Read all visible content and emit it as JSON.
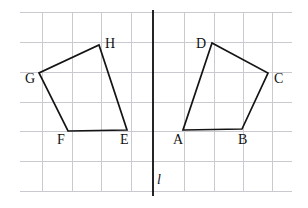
{
  "figure": {
    "width": 308,
    "height": 208,
    "background_color": "#ffffff"
  },
  "grid": {
    "line_color": "#c9c9cf",
    "x_start": 20,
    "x_end": 292,
    "y_start": 12,
    "y_end": 191,
    "vertical_x": [
      42,
      72,
      101,
      131,
      184,
      214,
      243,
      272
    ],
    "horizontal_y": [
      12,
      42,
      72,
      102,
      131,
      161,
      191
    ],
    "spacing": 30
  },
  "mirror_line": {
    "label": "l",
    "color": "#1a1a1a",
    "x": 153,
    "y_top": 10,
    "y_bottom": 196,
    "label_x": 157,
    "label_y": 173
  },
  "polygons": [
    {
      "name": "preimage-quadrilateral-abcd",
      "vertex_order": "A-B-C-D",
      "stroke_color": "#141414",
      "points": "183,130 242,129 268,73 212,43",
      "vertices": [
        {
          "label": "A",
          "x": 183,
          "y": 130,
          "label_x": 173,
          "label_y": 133
        },
        {
          "label": "B",
          "x": 242,
          "y": 129,
          "label_x": 238,
          "label_y": 133
        },
        {
          "label": "C",
          "x": 268,
          "y": 73,
          "label_x": 274,
          "label_y": 72
        },
        {
          "label": "D",
          "x": 212,
          "y": 43,
          "label_x": 196,
          "label_y": 37
        }
      ]
    },
    {
      "name": "image-quadrilateral-efgh",
      "vertex_order": "E-F-G-H",
      "stroke_color": "#141414",
      "points": "127,130 68,131 39,73 99,45",
      "vertices": [
        {
          "label": "E",
          "x": 127,
          "y": 130,
          "label_x": 120,
          "label_y": 133
        },
        {
          "label": "F",
          "x": 68,
          "y": 131,
          "label_x": 57,
          "label_y": 133
        },
        {
          "label": "G",
          "x": 39,
          "y": 73,
          "label_x": 25,
          "label_y": 72
        },
        {
          "label": "H",
          "x": 99,
          "y": 45,
          "label_x": 105,
          "label_y": 37
        }
      ]
    }
  ]
}
